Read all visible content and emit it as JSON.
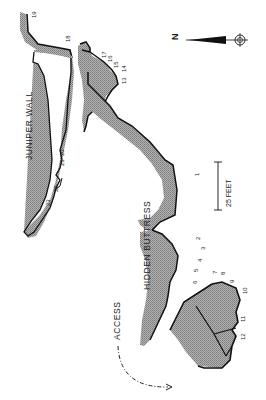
{
  "map": {
    "type": "climbing topo",
    "orientation": "rotated 90° (north points left)",
    "colors": {
      "rock_fill": "#a9a9a9",
      "outline": "#111111",
      "background": "#ffffff",
      "text": "#222222"
    },
    "areas": [
      {
        "name": "JUNIPER WALL"
      },
      {
        "name": "HIDDEN BUTTRESS"
      }
    ],
    "north_label": "N",
    "scale_label": "25 FEET",
    "access_label": "ACCESS",
    "routes": [
      "1",
      "2",
      "3",
      "4",
      "5",
      "6",
      "7",
      "8",
      "9",
      "10",
      "11",
      "12",
      "13",
      "14",
      "15",
      "16",
      "17",
      "18",
      "19",
      "20",
      "21",
      "22",
      "23"
    ]
  }
}
